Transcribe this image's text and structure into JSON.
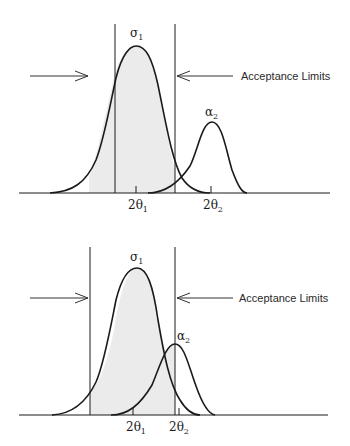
{
  "panels": [
    {
      "id": "top",
      "curve1_label": "σ",
      "curve1_sub": "1",
      "curve2_label": "α",
      "curve2_sub": "2",
      "annotation": "Acceptance Limits",
      "tick1_label": "2θ",
      "tick1_sub": "1",
      "tick2_label": "2θ",
      "tick2_sub": "2",
      "description": "Two well-separated distributions; acceptance limits enclose most of curve 1, excluding curve 2"
    },
    {
      "id": "bottom",
      "curve1_label": "σ",
      "curve1_sub": "1",
      "curve2_label": "α",
      "curve2_sub": "2",
      "annotation": "Acceptance Limits",
      "tick1_label": "2θ",
      "tick1_sub": "1",
      "tick2_label": "2θ",
      "tick2_sub": "2",
      "description": "Two overlapping distributions; acceptance region includes part of curve 2"
    }
  ],
  "colors": {
    "line": "#1a1a1a",
    "shade": "#ebebeb",
    "text": "#2a2a2a"
  }
}
